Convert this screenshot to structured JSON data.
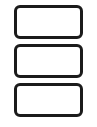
{
  "canvas": {
    "width": 97,
    "height": 127,
    "background_color": "#ffffff",
    "description": "Three blank rounded rectangles stacked vertically"
  },
  "style": {
    "border_color": "#1b1b1b",
    "fill_color": "#ffffff",
    "border_width_px": 3,
    "corner_radius_px": 6,
    "rect_width_px": 69,
    "rect_height_px": 34,
    "vertical_gap_px": 5
  },
  "shapes": [
    {
      "name": "rounded-rectangle-top",
      "label": "",
      "order": 1,
      "x": 13,
      "y": 5,
      "width": 69,
      "height": 34
    },
    {
      "name": "rounded-rectangle-middle",
      "label": "",
      "order": 2,
      "x": 13,
      "y": 44,
      "width": 69,
      "height": 34
    },
    {
      "name": "rounded-rectangle-bottom",
      "label": "",
      "order": 3,
      "x": 13,
      "y": 83,
      "width": 69,
      "height": 34
    }
  ]
}
